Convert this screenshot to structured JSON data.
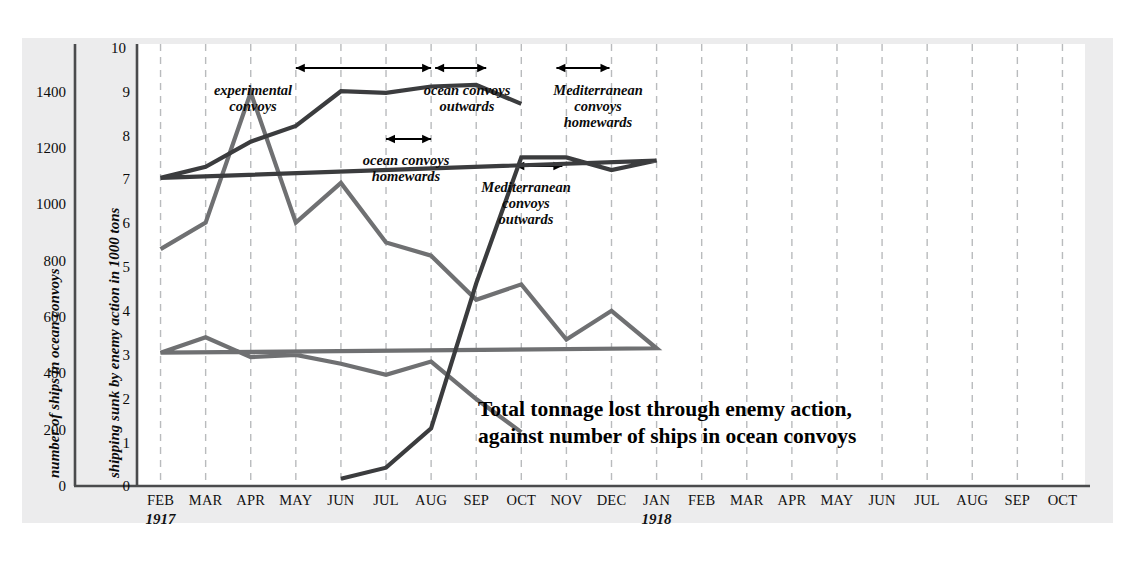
{
  "chart_data": {
    "type": "line",
    "categories": [
      "FEB",
      "MAR",
      "APR",
      "MAY",
      "JUN",
      "JUL",
      "AUG",
      "SEP",
      "OCT",
      "NOV",
      "DEC",
      "JAN",
      "FEB",
      "MAR",
      "APR",
      "MAY",
      "JUN",
      "JUL",
      "AUG",
      "SEP",
      "OCT"
    ],
    "year_labels": [
      {
        "text": "1917",
        "at": "FEB"
      },
      {
        "text": "1918",
        "at": "JAN"
      }
    ],
    "grid": true,
    "legend_position": "none",
    "axes": {
      "left": {
        "label": "number of ships in ocean convoys",
        "ticks": [
          0,
          200,
          400,
          600,
          800,
          1000,
          1200,
          1400
        ],
        "ylim": [
          0,
          1400
        ]
      },
      "right": {
        "label": "shipping sunk by enemy action in 1000 tons",
        "ticks": [
          1,
          2,
          3,
          4,
          5,
          6,
          7,
          8,
          9,
          10
        ],
        "ylim": [
          0,
          10
        ]
      },
      "xlabel": ""
    },
    "series": [
      {
        "name": "shipping sunk by enemy action in 1000 tons",
        "axis": "right",
        "color": "#6f7072",
        "x": [
          "FEB",
          "MAR",
          "APR",
          "MAY",
          "JUN",
          "JUL",
          "AUG",
          "SEP",
          "OCT",
          "NOV",
          "DEC",
          "JAN",
          "FEB",
          "MAR",
          "APR",
          "MAY",
          "JUN",
          "JUL",
          "AUG",
          "SEP",
          "OCT"
        ],
        "values": [
          5.35,
          5.95,
          8.9,
          5.95,
          6.85,
          5.5,
          5.2,
          4.2,
          4.55,
          3.3,
          3.95,
          3.1,
          3.0,
          3.35,
          2.9,
          2.95,
          2.75,
          2.5,
          2.8,
          1.95,
          1.2
        ]
      },
      {
        "name": "number of ships in ocean convoys",
        "axis": "left",
        "color": "#3b3c3e",
        "x": [
          "JUN",
          "JUL",
          "AUG",
          "SEP",
          "OCT",
          "NOV",
          "DEC",
          "JAN",
          "FEB",
          "MAR",
          "APR",
          "MAY",
          "JUN",
          "JUL",
          "AUG",
          "SEP",
          "OCT"
        ],
        "values": [
          20,
          55,
          180,
          640,
          1040,
          1040,
          1000,
          1030,
          975,
          1010,
          1090,
          1140,
          1250,
          1245,
          1265,
          1270,
          1210
        ]
      }
    ],
    "annotations": [
      {
        "id": "experimental-convoys",
        "text": "experimental\nconvoys",
        "arrow_from": "MAY-1917",
        "arrow_to": "AUG-1917"
      },
      {
        "id": "ocean-convoys-outwards",
        "text": "ocean convoys\noutwards",
        "arrow_from": "AUG-1917",
        "arrow_to": "SEP-1917"
      },
      {
        "id": "mediterranean-convoys-homewards",
        "text": "Mediterranean\nconvoys\nhomewards",
        "arrow_from": "OCT-1917",
        "arrow_to": "NOV-1917"
      },
      {
        "id": "ocean-convoys-homewards",
        "text": "ocean convoys\nhomewards",
        "arrow_from": "JUL-1917",
        "arrow_to": "AUG-1917"
      },
      {
        "id": "mediterranean-convoys-outwards",
        "text": "Mediterranean\nconvoys\noutwards",
        "arrow_from": "SEP-1917",
        "arrow_to": "OCT-1917"
      }
    ]
  },
  "axis_left": {
    "title": "number of ships in ocean convoys",
    "t0": "0",
    "t1": "200",
    "t2": "400",
    "t3": "600",
    "t4": "800",
    "t5": "1000",
    "t6": "1200",
    "t7": "1400"
  },
  "axis_right": {
    "title": "shipping sunk by enemy action in 1000 tons",
    "t1": "1",
    "t2": "2",
    "t3": "3",
    "t4": "4",
    "t5": "5",
    "t6": "6",
    "t7": "7",
    "t8": "8",
    "t9": "9",
    "t10": "10"
  },
  "months": {
    "m0": "FEB",
    "m1": "MAR",
    "m2": "APR",
    "m3": "MAY",
    "m4": "JUN",
    "m5": "JUL",
    "m6": "AUG",
    "m7": "SEP",
    "m8": "OCT",
    "m9": "NOV",
    "m10": "DEC",
    "m11": "JAN",
    "m12": "FEB",
    "m13": "MAR",
    "m14": "APR",
    "m15": "MAY",
    "m16": "JUN",
    "m17": "JUL",
    "m18": "AUG",
    "m19": "SEP",
    "m20": "OCT"
  },
  "years": {
    "y1917": "1917",
    "y1918": "1918"
  },
  "annotations": {
    "a0": "experimental\nconvoys",
    "a1": "ocean convoys\noutwards",
    "a2": "Mediterranean\nconvoys\nhomewards",
    "a3": "ocean convoys\nhomewards",
    "a4": "Mediterranean\nconvoys\noutwards"
  },
  "caption": {
    "text": "Total tonnage lost through enemy action,\nagainst number of ships in ocean convoys"
  },
  "colors": {
    "panel_bg": "#ececed",
    "plot_bg": "#ffffff",
    "tonnage_line": "#6f7072",
    "ships_line": "#3b3c3e",
    "grid": "#b9bbbd",
    "axis": "#4a4b4d"
  }
}
